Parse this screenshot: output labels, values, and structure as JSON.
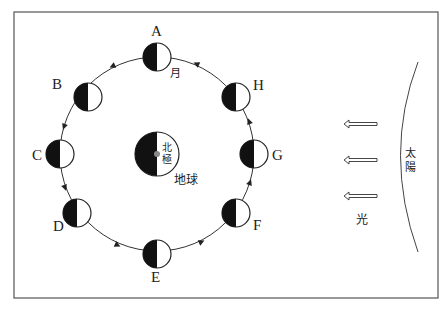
{
  "diagram": {
    "title": "",
    "frame": {
      "x": 14,
      "y": 12,
      "w": 424,
      "h": 286,
      "stroke": "#555555"
    },
    "orbit": {
      "cx": 157,
      "cy": 154,
      "r": 97,
      "direction": "counterclockwise"
    },
    "earth": {
      "cx": 157,
      "cy": 154,
      "r": 22,
      "label": "地球",
      "pole_label_1": "北",
      "pole_label_2": "極",
      "dark_side": "left"
    },
    "moon_label": "月",
    "moons": [
      {
        "id": "A",
        "label": "A",
        "angle": 90
      },
      {
        "id": "B",
        "label": "B",
        "angle": 135
      },
      {
        "id": "C",
        "label": "C",
        "angle": 180
      },
      {
        "id": "D",
        "label": "D",
        "angle": 225
      },
      {
        "id": "E",
        "label": "E",
        "angle": 270
      },
      {
        "id": "F",
        "label": "F",
        "angle": 315
      },
      {
        "id": "G",
        "label": "G",
        "angle": 0
      },
      {
        "id": "H",
        "label": "H",
        "angle": 45
      }
    ],
    "moon_radius": 14,
    "sun": {
      "label_1": "太",
      "label_2": "陽"
    },
    "light": {
      "label": "光",
      "arrow_count": 3,
      "direction": "left"
    },
    "colors": {
      "dark": "#111111",
      "light": "#ffffff",
      "line": "#333333"
    }
  }
}
